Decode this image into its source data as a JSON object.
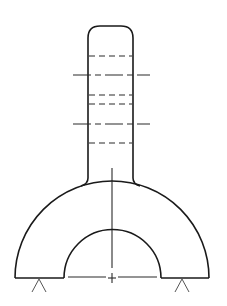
{
  "drawing": {
    "type": "technical-section-drawing",
    "subject": "stem on semicircular arch with supports",
    "line_color": "#1a1a1a",
    "background": "#ffffff",
    "stem": {
      "left_x": 88,
      "right_x": 133,
      "top_y": 26,
      "corner_radius": 12,
      "bottom_y": 180
    },
    "hidden_lines_y": [
      56,
      95,
      104,
      143
    ],
    "center_lines_y": [
      75,
      124
    ],
    "arch": {
      "center_x": 112,
      "base_y": 278,
      "outer_radius": 97,
      "inner_radius": 48
    },
    "supports": [
      {
        "apex_x": 39,
        "apex_y": 279
      },
      {
        "apex_x": 182,
        "apex_y": 279
      }
    ]
  }
}
